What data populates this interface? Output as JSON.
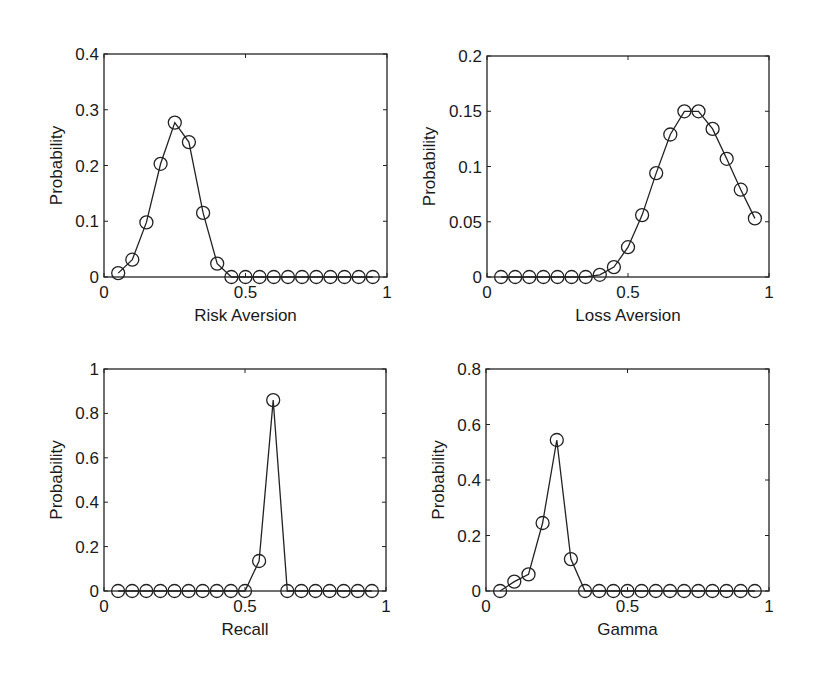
{
  "figure": {
    "width": 816,
    "height": 682,
    "line_color": "#222222",
    "background": "#ffffff"
  },
  "chart_data": [
    {
      "type": "line",
      "id": "risk-aversion",
      "title": "",
      "xlabel": "Risk Aversion",
      "ylabel": "Probability",
      "xlim": [
        0,
        1
      ],
      "ylim": [
        0,
        0.4
      ],
      "xticks": [
        0,
        0.5,
        1
      ],
      "xtick_labels": [
        "0",
        "0.5",
        "1"
      ],
      "yticks": [
        0,
        0.1,
        0.2,
        0.3,
        0.4
      ],
      "ytick_labels": [
        "0",
        "0.1",
        "0.2",
        "0.3",
        "0.4"
      ],
      "grid": false,
      "marker": "circle",
      "frame_px": {
        "left": 104,
        "top": 54,
        "right": 387,
        "bottom": 277
      },
      "x": [
        0.05,
        0.1,
        0.15,
        0.2,
        0.25,
        0.3,
        0.35,
        0.4,
        0.45,
        0.5,
        0.55,
        0.6,
        0.65,
        0.7,
        0.75,
        0.8,
        0.85,
        0.9,
        0.95
      ],
      "values": [
        0.007,
        0.031,
        0.098,
        0.203,
        0.277,
        0.242,
        0.115,
        0.024,
        0,
        0,
        0,
        0,
        0,
        0,
        0,
        0,
        0,
        0,
        0
      ]
    },
    {
      "type": "line",
      "id": "loss-aversion",
      "title": "",
      "xlabel": "Loss Aversion",
      "ylabel": "Probability",
      "xlim": [
        0,
        1
      ],
      "ylim": [
        0,
        0.2
      ],
      "xticks": [
        0,
        0.5,
        1
      ],
      "xtick_labels": [
        "0",
        "0.5",
        "1"
      ],
      "yticks": [
        0,
        0.05,
        0.1,
        0.15,
        0.2
      ],
      "ytick_labels": [
        "0",
        "0.05",
        "0.1",
        "0.15",
        "0.2"
      ],
      "grid": false,
      "marker": "circle",
      "frame_px": {
        "left": 487,
        "top": 56,
        "right": 769,
        "bottom": 277
      },
      "x": [
        0.05,
        0.1,
        0.15,
        0.2,
        0.25,
        0.3,
        0.35,
        0.4,
        0.45,
        0.5,
        0.55,
        0.6,
        0.65,
        0.7,
        0.75,
        0.8,
        0.85,
        0.9,
        0.95
      ],
      "values": [
        0,
        0,
        0,
        0,
        0,
        0,
        0,
        0.002,
        0.009,
        0.027,
        0.056,
        0.094,
        0.129,
        0.15,
        0.15,
        0.134,
        0.107,
        0.079,
        0.053
      ]
    },
    {
      "type": "line",
      "id": "recall",
      "title": "",
      "xlabel": "Recall",
      "ylabel": "Probability",
      "xlim": [
        0,
        1
      ],
      "ylim": [
        0,
        1
      ],
      "xticks": [
        0,
        0.5,
        1
      ],
      "xtick_labels": [
        "0",
        "0.5",
        "1"
      ],
      "yticks": [
        0,
        0.2,
        0.4,
        0.6,
        0.8,
        1
      ],
      "ytick_labels": [
        "0",
        "0.2",
        "0.4",
        "0.6",
        "0.8",
        "1"
      ],
      "grid": false,
      "marker": "circle",
      "frame_px": {
        "left": 104,
        "top": 369,
        "right": 386,
        "bottom": 591
      },
      "x": [
        0.05,
        0.1,
        0.15,
        0.2,
        0.25,
        0.3,
        0.35,
        0.4,
        0.45,
        0.5,
        0.55,
        0.6,
        0.65,
        0.7,
        0.75,
        0.8,
        0.85,
        0.9,
        0.95
      ],
      "values": [
        0,
        0,
        0,
        0,
        0,
        0,
        0,
        0,
        0,
        0,
        0.135,
        0.86,
        0,
        0,
        0,
        0,
        0,
        0,
        0
      ]
    },
    {
      "type": "line",
      "id": "gamma",
      "title": "",
      "xlabel": "Gamma",
      "ylabel": "Probability",
      "xlim": [
        0,
        1
      ],
      "ylim": [
        0,
        0.8
      ],
      "xticks": [
        0,
        0.5,
        1
      ],
      "xtick_labels": [
        "0",
        "0.5",
        "1"
      ],
      "yticks": [
        0,
        0.2,
        0.4,
        0.6,
        0.8
      ],
      "ytick_labels": [
        "0",
        "0.2",
        "0.4",
        "0.6",
        "0.8"
      ],
      "grid": false,
      "marker": "circle",
      "frame_px": {
        "left": 486,
        "top": 369,
        "right": 769,
        "bottom": 591
      },
      "x": [
        0.05,
        0.1,
        0.15,
        0.2,
        0.25,
        0.3,
        0.35,
        0.4,
        0.45,
        0.5,
        0.55,
        0.6,
        0.65,
        0.7,
        0.75,
        0.8,
        0.85,
        0.9,
        0.95
      ],
      "values": [
        0,
        0.034,
        0.06,
        0.245,
        0.544,
        0.115,
        0,
        0,
        0,
        0,
        0,
        0,
        0,
        0,
        0,
        0,
        0,
        0,
        0
      ]
    }
  ]
}
